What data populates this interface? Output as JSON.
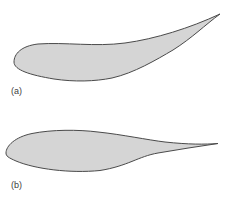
{
  "figure": {
    "background_color": "#ffffff",
    "shape_fill": "#d5d5d5",
    "shape_stroke": "#4a4a4a",
    "label_color": "#3d3d3d",
    "panels": [
      {
        "label": "(a)",
        "shape": "curved cambered teardrop with upswept pointed tail"
      },
      {
        "label": "(b)",
        "shape": "horizontal streamlined airfoil with rounded nose and pointed tail"
      }
    ]
  }
}
